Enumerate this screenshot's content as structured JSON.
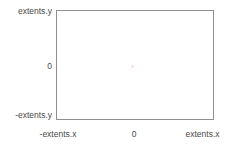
{
  "chart_data": {
    "type": "scatter",
    "title": "",
    "xlabel": "",
    "ylabel": "",
    "grid": false,
    "legend": null,
    "x_tick_labels": [
      "-extents.x",
      "0",
      "extents.x"
    ],
    "y_tick_labels": [
      "extents.y",
      "0",
      "-extents.y"
    ],
    "xlim": [
      "-extents.x",
      "extents.x"
    ],
    "ylim": [
      "-extents.y",
      "extents.y"
    ],
    "series": [
      {
        "name": "origin-marker",
        "x": [
          0
        ],
        "y": [
          0
        ],
        "color": "#f3e2e8"
      }
    ],
    "frame_color": "#8f8f8f",
    "background_color": "#ffffff",
    "text_color": "#4a4a4a"
  },
  "axes": {
    "y": {
      "max_label": "extents.y",
      "zero_label": "0",
      "min_label": "-extents.y"
    },
    "x": {
      "min_label": "-extents.x",
      "zero_label": "0",
      "max_label": "extents.x"
    }
  }
}
